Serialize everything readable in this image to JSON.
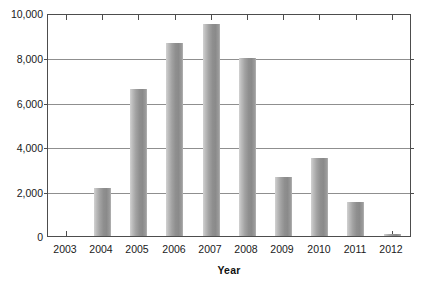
{
  "chart_data": {
    "type": "bar",
    "title": "",
    "subtitle": "",
    "xlabel": "Year",
    "ylabel": "",
    "categories": [
      "2003",
      "2004",
      "2005",
      "2006",
      "2007",
      "2008",
      "2009",
      "2010",
      "2011",
      "2012"
    ],
    "values": [
      0,
      2150,
      6620,
      8700,
      9530,
      8010,
      2660,
      3510,
      1540,
      100
    ],
    "series": [
      {
        "name": "",
        "values": [
          0,
          2150,
          6620,
          8700,
          9530,
          8010,
          2660,
          3510,
          1540,
          100
        ]
      }
    ],
    "ylim": [
      0,
      10000
    ],
    "ytick_labels": [
      "0",
      "2,000",
      "4,000",
      "6,000",
      "8,000",
      "10,000"
    ],
    "ytick_values": [
      0,
      2000,
      4000,
      6000,
      8000,
      10000
    ],
    "grid": true,
    "grid_axis": "y",
    "legend": false,
    "legend_position": "none",
    "bar_color": "#9a9a9a",
    "frame_color": "#4d4d4d",
    "gridline_color": "#8f8f8f",
    "background_color": "#ffffff",
    "text_color": "#1a1a1a"
  },
  "axes": {
    "x_title": "Year",
    "y_title": ""
  }
}
